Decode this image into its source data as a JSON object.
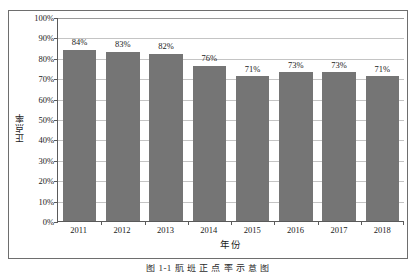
{
  "chart_data": {
    "type": "bar",
    "title": "",
    "xlabel": "年份",
    "ylabel": "正点率",
    "categories": [
      "2011",
      "2012",
      "2013",
      "2014",
      "2015",
      "2016",
      "2017",
      "2018"
    ],
    "values": [
      84,
      83,
      82,
      76,
      71,
      73,
      73,
      71
    ],
    "value_labels": [
      "84%",
      "83%",
      "82%",
      "76%",
      "71%",
      "73%",
      "73%",
      "71%"
    ],
    "ylim": [
      0,
      100
    ],
    "ytick_values": [
      0,
      10,
      20,
      30,
      40,
      50,
      60,
      70,
      80,
      90,
      100
    ],
    "ytick_labels": [
      "0%",
      "10%",
      "20%",
      "30%",
      "40%",
      "50%",
      "60%",
      "70%",
      "80%",
      "90%",
      "100%"
    ],
    "grid": "horizontal",
    "legend": "none",
    "series_color": "#757575",
    "gridline_color": "#c4c4c4",
    "axis_color": "#5a5a5a",
    "frame_color": "#6e6e6e",
    "bar_label_position": "above"
  },
  "caption": {
    "text": "图 1-1  航 班 正 点 率 示 意 图"
  }
}
